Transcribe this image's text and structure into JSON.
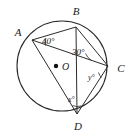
{
  "figure": {
    "type": "circle-geometry-diagram",
    "background_color": "#ffffff",
    "stroke_color": "#2b2b2b"
  },
  "circle": {
    "center_label": "O",
    "center_x": 62,
    "center_y": 66,
    "radius": 45,
    "center_dot_x": 56,
    "center_dot_y": 66
  },
  "vertices": [
    {
      "id": "A",
      "label": "A",
      "x": 32,
      "y": 40,
      "label_x": 18,
      "label_y": 36
    },
    {
      "id": "B",
      "label": "B",
      "x": 76,
      "y": 27,
      "label_x": 76,
      "label_y": 15
    },
    {
      "id": "C",
      "label": "C",
      "x": 108,
      "y": 66,
      "label_x": 121,
      "label_y": 72
    },
    {
      "id": "D",
      "label": "D",
      "x": 77,
      "y": 114,
      "label_x": 78,
      "label_y": 130
    }
  ],
  "chords": [
    {
      "name": "chord-AB",
      "from": "A",
      "to": "B"
    },
    {
      "name": "chord-AC",
      "from": "A",
      "to": "C"
    },
    {
      "name": "chord-AD",
      "from": "A",
      "to": "D"
    },
    {
      "name": "chord-BC",
      "from": "B",
      "to": "C"
    },
    {
      "name": "chord-CD",
      "from": "C",
      "to": "D"
    },
    {
      "name": "chord-BD",
      "from": "B",
      "to": "D"
    }
  ],
  "angles": [
    {
      "id": "angle-A",
      "label": "40°",
      "value": 40,
      "vertex": "A",
      "label_x": 42,
      "label_y": 44,
      "size": "normal"
    },
    {
      "id": "angle-B",
      "label": "30°",
      "value": 30,
      "vertex": "B",
      "label_x": 72,
      "label_y": 55,
      "size": "normal"
    },
    {
      "id": "angle-y",
      "label": "y°",
      "value": "y",
      "vertex": "C",
      "label_x": 88,
      "label_y": 80,
      "size": "small"
    },
    {
      "id": "angle-x",
      "label": "x°",
      "value": "x",
      "vertex": "D",
      "label_x": 68,
      "label_y": 102,
      "size": "small"
    }
  ]
}
